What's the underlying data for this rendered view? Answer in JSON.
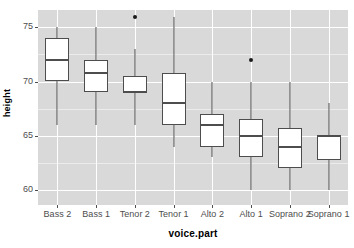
{
  "chart_data": {
    "type": "box",
    "title": "",
    "xlabel": "voice.part",
    "ylabel": "height",
    "categories": [
      "Bass 2",
      "Bass 1",
      "Tenor 2",
      "Tenor 1",
      "Alto 2",
      "Alto 1",
      "Soprano 2",
      "Soprano 1"
    ],
    "ylim": [
      58.6,
      76.6
    ],
    "yticks": [
      60,
      65,
      70,
      75
    ],
    "ytick_labels": [
      "60",
      "65",
      "70",
      "75"
    ],
    "yminor": [
      62.5,
      67.5,
      72.5
    ],
    "grid": true,
    "legend": "none",
    "boxes": [
      {
        "category": "Bass 2",
        "whisker_low": 66.0,
        "q1": 70.0,
        "median": 72.0,
        "q3": 74.0,
        "whisker_high": 75.0,
        "outliers": []
      },
      {
        "category": "Bass 1",
        "whisker_low": 66.0,
        "q1": 69.0,
        "median": 70.75,
        "q3": 72.0,
        "whisker_high": 75.0,
        "outliers": []
      },
      {
        "category": "Tenor 2",
        "whisker_low": 66.0,
        "q1": 69.0,
        "median": 69.0,
        "q3": 70.5,
        "whisker_high": 73.0,
        "outliers": [
          76.0
        ]
      },
      {
        "category": "Tenor 1",
        "whisker_low": 64.0,
        "q1": 66.0,
        "median": 68.0,
        "q3": 70.75,
        "whisker_high": 76.0,
        "outliers": []
      },
      {
        "category": "Alto 2",
        "whisker_low": 63.0,
        "q1": 64.0,
        "median": 66.0,
        "q3": 67.0,
        "whisker_high": 70.0,
        "outliers": []
      },
      {
        "category": "Alto 1",
        "whisker_low": 60.0,
        "q1": 63.0,
        "median": 65.0,
        "q3": 66.5,
        "whisker_high": 70.0,
        "outliers": [
          72.0
        ]
      },
      {
        "category": "Soprano 2",
        "whisker_low": 60.0,
        "q1": 62.0,
        "median": 64.0,
        "q3": 65.75,
        "whisker_high": 70.0,
        "outliers": []
      },
      {
        "category": "Soprano 1",
        "whisker_low": 60.0,
        "q1": 62.75,
        "median": 65.0,
        "q3": 65.0,
        "whisker_high": 68.0,
        "outliers": []
      }
    ]
  },
  "axes": {
    "y_title": "height",
    "x_title": "voice.part"
  },
  "colors": {
    "panel_background": "#d9d9d9",
    "grid_major": "#ffffff",
    "grid_minor": "#ececec",
    "box_fill": "#ffffff",
    "box_stroke": "#4d4d4d",
    "outlier": "#1a1a1a",
    "text": "#4d4d4d",
    "figure_background": "#ffffff"
  }
}
